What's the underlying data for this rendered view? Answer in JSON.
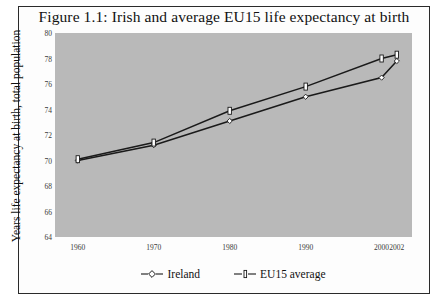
{
  "figure": {
    "title": "Figure 1.1: Irish and average EU15 life expectancy at birth",
    "frame_color": "#2a2a2a",
    "plot_background": "#b9b9b9",
    "line_color": "#1a1a1a"
  },
  "chart_data": {
    "type": "line",
    "title": "Figure 1.1: Irish and average EU15 life expectancy at birth",
    "xlabel": "",
    "ylabel": "Years life expectancy at birth, total population",
    "categories": [
      "1960",
      "1970",
      "1980",
      "1990",
      "2000",
      "2002"
    ],
    "x_positions": [
      1960,
      1970,
      1980,
      1990,
      2000,
      2002
    ],
    "xlim": [
      1957,
      2004
    ],
    "ylim": [
      64,
      80
    ],
    "yticks": [
      64,
      66,
      68,
      70,
      72,
      74,
      76,
      78,
      80
    ],
    "grid": false,
    "legend_position": "bottom",
    "series": [
      {
        "name": "Ireland",
        "marker": "open-diamond",
        "values": [
          70.0,
          71.2,
          73.1,
          75.0,
          76.5,
          77.8
        ]
      },
      {
        "name": "EU15 average",
        "marker": "vertical-bar",
        "values": [
          70.1,
          71.4,
          73.9,
          75.8,
          78.0,
          78.3
        ]
      }
    ]
  },
  "legend": {
    "items": [
      {
        "label": "Ireland"
      },
      {
        "label": "EU15 average"
      }
    ]
  }
}
